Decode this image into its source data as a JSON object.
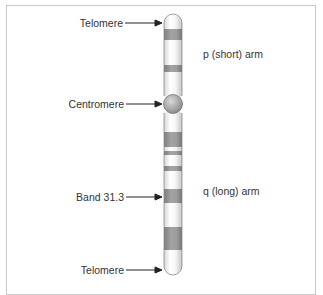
{
  "diagram": {
    "labels": {
      "telomere_top": "Telomere",
      "centromere": "Centromere",
      "band": "Band 31.3",
      "telomere_bottom": "Telomere",
      "p_arm": "p (short) arm",
      "q_arm": "q (long) arm"
    },
    "colors": {
      "dark_band": "#9a9a9a",
      "light_band": "#f2f2f2",
      "outline": "#8a8a8a",
      "centromere": "#a8a8a8",
      "text": "#333333",
      "frame": "#c8c8c8"
    }
  }
}
